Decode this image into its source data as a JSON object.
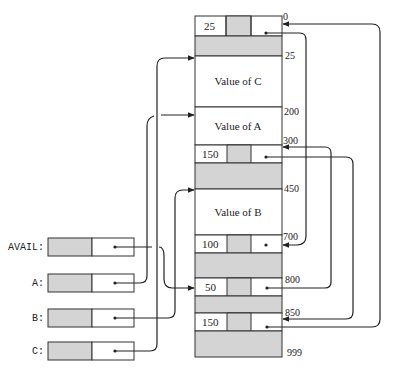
{
  "diagram": {
    "memory": {
      "addresses": [
        "0",
        "25",
        "200",
        "300",
        "450",
        "700",
        "800",
        "850",
        "999"
      ],
      "values": {
        "c": "Value of C",
        "a": "Value of A",
        "b": "Value of B"
      },
      "block_sizes": {
        "b0": "25",
        "b300": "150",
        "b700": "100",
        "b800": "50",
        "b850": "150"
      }
    },
    "variables": [
      {
        "label": "AVAIL:"
      },
      {
        "label": "A:"
      },
      {
        "label": "B:"
      },
      {
        "label": "C:"
      }
    ],
    "colors": {
      "shade": "#d4d4d4",
      "line": "#222222",
      "background": "#ffffff"
    }
  }
}
